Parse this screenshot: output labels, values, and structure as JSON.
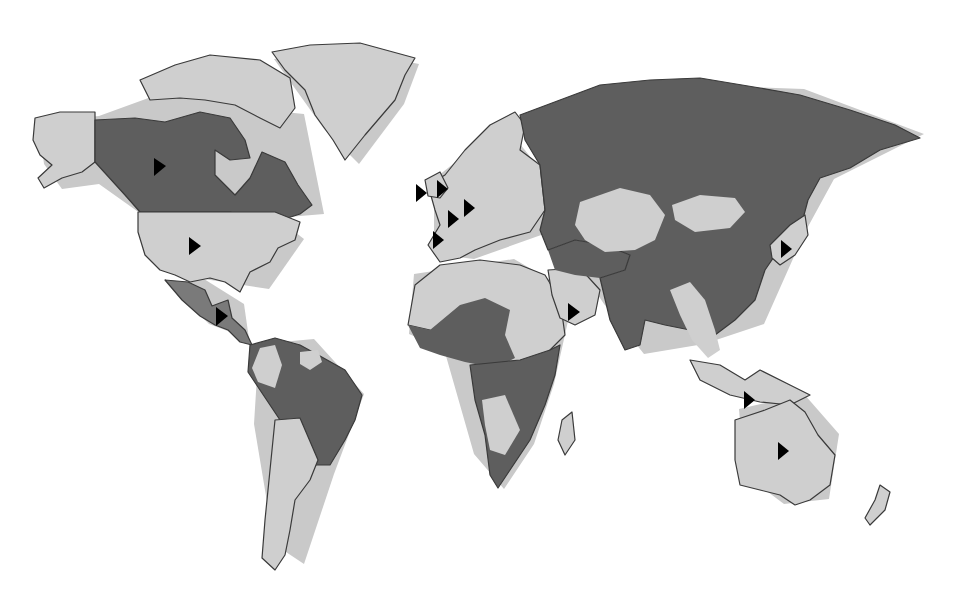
{
  "map": {
    "type": "world-choropleth",
    "style": "grayscale",
    "colors": {
      "background": "#ffffff",
      "category_light": "#cfcfcf",
      "category_dark": "#5e5e5e",
      "category_mid": "#7a7a7a",
      "outline": "#3a3a3a",
      "marker": "#000000"
    },
    "regions": [
      {
        "name": "Alaska",
        "shade": "light"
      },
      {
        "name": "Canada",
        "shade": "dark"
      },
      {
        "name": "Greenland",
        "shade": "light"
      },
      {
        "name": "Canadian Arctic Archipelago",
        "shade": "light"
      },
      {
        "name": "United States",
        "shade": "light"
      },
      {
        "name": "Mexico & Central America",
        "shade": "mid"
      },
      {
        "name": "Northern South America (Colombia)",
        "shade": "light"
      },
      {
        "name": "Guianas",
        "shade": "light"
      },
      {
        "name": "Brazil & Andes",
        "shade": "dark"
      },
      {
        "name": "Southern Cone (Argentina/Chile)",
        "shade": "light"
      },
      {
        "name": "Europe",
        "shade": "light"
      },
      {
        "name": "North Africa",
        "shade": "light"
      },
      {
        "name": "Sahel & West Africa",
        "shade": "dark"
      },
      {
        "name": "Horn/East Sahara",
        "shade": "light"
      },
      {
        "name": "Central & Southern Africa",
        "shade": "dark"
      },
      {
        "name": "Angola/Namibia region",
        "shade": "light"
      },
      {
        "name": "Madagascar",
        "shade": "light"
      },
      {
        "name": "Arabian Peninsula",
        "shade": "light"
      },
      {
        "name": "Russia / Siberia",
        "shade": "dark"
      },
      {
        "name": "Central Asia",
        "shade": "light"
      },
      {
        "name": "Mongolia",
        "shade": "light"
      },
      {
        "name": "Iran / Middle East",
        "shade": "dark"
      },
      {
        "name": "South Asia & China",
        "shade": "dark"
      },
      {
        "name": "Southeast Asia (mainland)",
        "shade": "light"
      },
      {
        "name": "Maritime Southeast Asia",
        "shade": "light"
      },
      {
        "name": "Japan",
        "shade": "light"
      },
      {
        "name": "Australia",
        "shade": "light"
      },
      {
        "name": "New Zealand",
        "shade": "light"
      }
    ],
    "markers": [
      {
        "id": "canada",
        "x": 160,
        "y": 166
      },
      {
        "id": "usa",
        "x": 194,
        "y": 246
      },
      {
        "id": "central-america",
        "x": 221,
        "y": 316
      },
      {
        "id": "ireland",
        "x": 421,
        "y": 193
      },
      {
        "id": "uk",
        "x": 442,
        "y": 189
      },
      {
        "id": "germany",
        "x": 469,
        "y": 208
      },
      {
        "id": "france",
        "x": 453,
        "y": 219
      },
      {
        "id": "spain",
        "x": 438,
        "y": 240
      },
      {
        "id": "arabia",
        "x": 573,
        "y": 312
      },
      {
        "id": "japan",
        "x": 786,
        "y": 249
      },
      {
        "id": "indonesia",
        "x": 749,
        "y": 400
      },
      {
        "id": "australia",
        "x": 783,
        "y": 451
      }
    ]
  }
}
